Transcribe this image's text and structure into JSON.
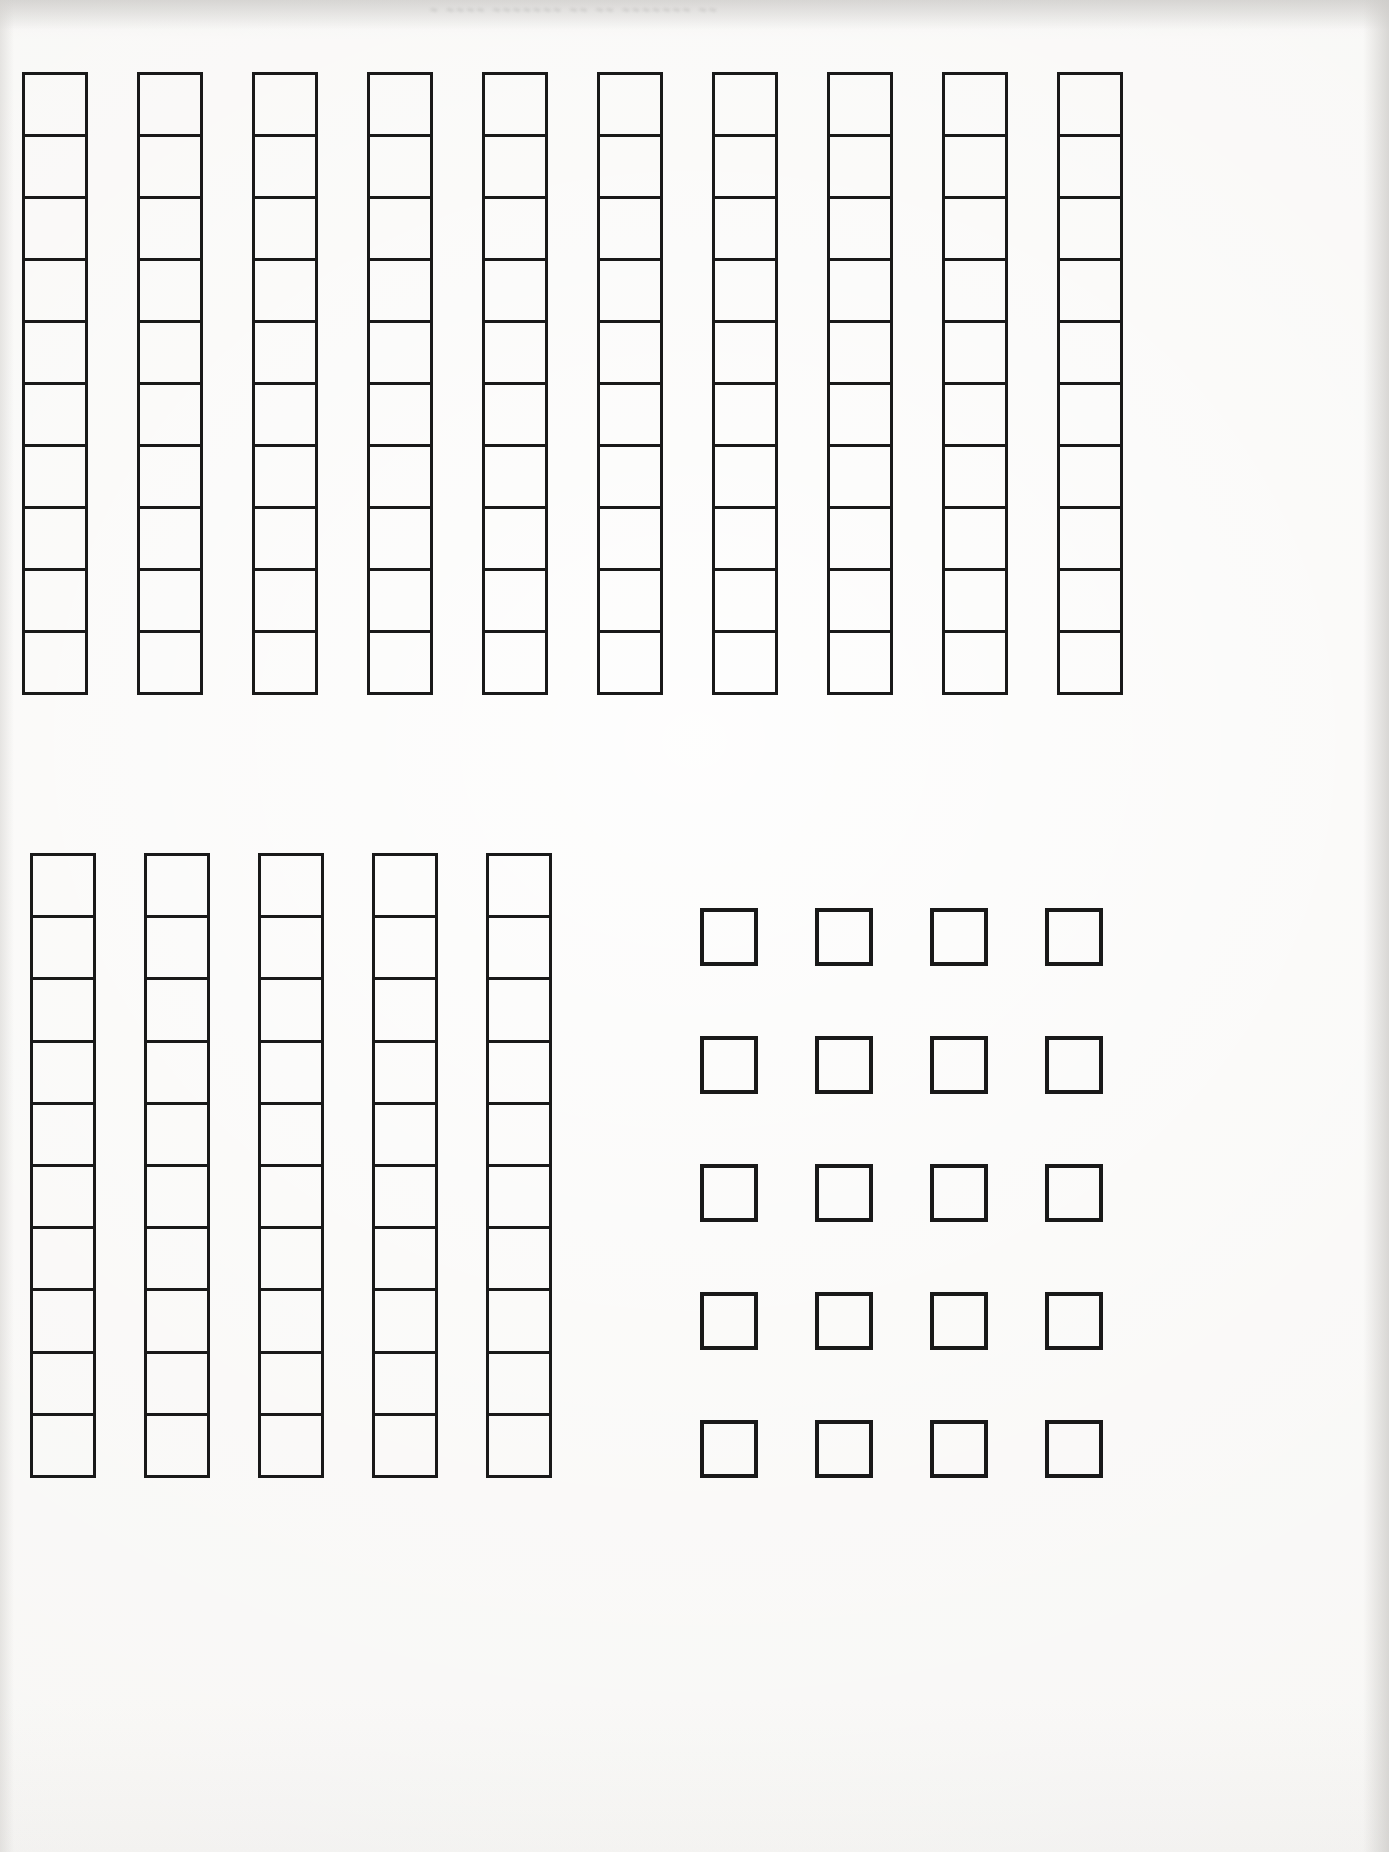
{
  "document": {
    "title": "Base-Ten Blocks Cut-Out Sheet",
    "paper_color": "#f6f5f3",
    "ink_color": "#191919",
    "ghost_header_text": "~ ~~~~  ~~~~~~~  ~~  ~~ ~~~~~~~ ~~"
  },
  "groups": [
    {
      "id": "top-tens-row",
      "name": "Top row of ten-rods",
      "kind": "rods",
      "rod_count": 10,
      "cells_per_rod": 10,
      "total_units": 100,
      "x": 22,
      "y": 72,
      "rod_width": 66,
      "rod_height": 623,
      "rod_pitch": 115
    },
    {
      "id": "bottom-left-tens",
      "name": "Lower-left group of ten-rods",
      "kind": "rods",
      "rod_count": 5,
      "cells_per_rod": 10,
      "total_units": 50,
      "x": 30,
      "y": 853,
      "rod_width": 66,
      "rod_height": 625,
      "rod_pitch": 114
    },
    {
      "id": "bottom-right-ones",
      "name": "Lower-right grid of unit squares",
      "kind": "units",
      "columns": 4,
      "rows": 5,
      "total_units": 20,
      "x": 700,
      "y": 908,
      "square_size": 58,
      "column_pitch": 115,
      "row_pitch": 128
    }
  ],
  "summary": {
    "rods_total": 15,
    "rod_value": 10,
    "unit_squares_total": 20,
    "grand_total_units": 170
  }
}
